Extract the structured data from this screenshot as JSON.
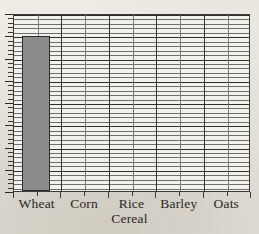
{
  "chart_data": {
    "type": "bar",
    "title": "",
    "xlabel": "Cereal",
    "ylabel": "",
    "categories": [
      "Wheat",
      "Corn",
      "Rice",
      "Barley",
      "Oats"
    ],
    "values": [
      100,
      0,
      0,
      0,
      0
    ],
    "ylim": [
      0,
      115
    ],
    "grid": "horizontal minor and major gridlines, vertical category gridlines",
    "legend": "none",
    "axis_tick_labels_y": [],
    "bar_color": "#8b8b8b",
    "bar_border_color": "#2b2b2b",
    "grid_minor_color": "#6e6e6e",
    "grid_major_color": "#2e2e2e",
    "plot_background": "#f3f1ec",
    "page_background": "#eceae4"
  },
  "axes": {
    "x_title": "Cereal",
    "x_categories": [
      "Wheat",
      "Corn",
      "Rice",
      "Barley",
      "Oats"
    ],
    "y_minor_tick_count": 40,
    "y_major_tick_count": 8
  }
}
